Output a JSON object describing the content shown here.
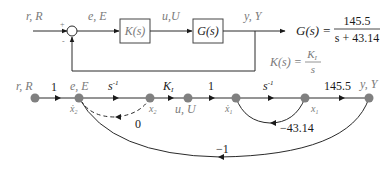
{
  "block_diagram": {
    "input_label": "r, R",
    "sum_plus": "+",
    "sum_minus": "-",
    "error_label": "e, E",
    "controller_block": "K(s)",
    "control_label": "u,U",
    "plant_block": "G(s)",
    "output_label": "y, Y",
    "plant_tf": {
      "lhs": "G(s) =",
      "numerator": "145.5",
      "denominator": "s + 43.14"
    },
    "controller_tf": {
      "lhs": "K(s) =",
      "numerator": "K",
      "numerator_sub": "I",
      "denominator": "s"
    }
  },
  "signal_flow_graph": {
    "nodes": [
      {
        "id": "r",
        "top_label": "r, R",
        "bottom_label": ""
      },
      {
        "id": "e",
        "top_label": "e, E",
        "bottom_label": "ẋ",
        "bottom_sub": "2"
      },
      {
        "id": "x2",
        "top_label": "",
        "bottom_label": "x",
        "bottom_sub": "2"
      },
      {
        "id": "u",
        "top_label": "",
        "bottom_label": "u, U"
      },
      {
        "id": "x1dot",
        "top_label": "",
        "bottom_label": "ẋ",
        "bottom_sub": "1"
      },
      {
        "id": "x1",
        "top_label": "",
        "bottom_label": "x",
        "bottom_sub": "1"
      },
      {
        "id": "y",
        "top_label": "y, Y",
        "bottom_label": ""
      }
    ],
    "branches": [
      {
        "from": "r",
        "to": "e",
        "gain": "1"
      },
      {
        "from": "e",
        "to": "x2",
        "gain": "s",
        "gain_sup": "-1"
      },
      {
        "from": "x2",
        "to": "u",
        "gain": "K",
        "gain_sub": "I"
      },
      {
        "from": "u",
        "to": "x1dot",
        "gain": "1"
      },
      {
        "from": "x1dot",
        "to": "x1",
        "gain": "s",
        "gain_sup": "-1"
      },
      {
        "from": "x1",
        "to": "y",
        "gain": "145.5"
      },
      {
        "from": "x2",
        "to": "e",
        "gain": "0",
        "style": "dashed"
      },
      {
        "from": "x1",
        "to": "x1dot",
        "gain": "-43.14"
      },
      {
        "from": "y",
        "to": "e",
        "gain": "-1"
      }
    ],
    "labels": {
      "g_r_e": "1",
      "g_e_x2": "s",
      "g_e_x2_sup": "-1",
      "g_x2_u": "K",
      "g_x2_u_sub": "I",
      "g_u_x1d": "1",
      "g_x1d_x1": "s",
      "g_x1d_x1_sup": "-1",
      "g_x1_y": "145.5",
      "g_x2_e": "0",
      "g_x1_x1d": "−43.14",
      "g_y_e": "−1"
    }
  },
  "colors": {
    "line": "#2a2a2a",
    "node": "#808080",
    "label_gray": "#7a7a7a",
    "label_dark": "#1a1a1a"
  }
}
